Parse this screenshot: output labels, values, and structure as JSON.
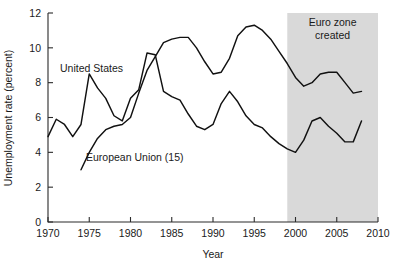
{
  "chart_data": {
    "type": "line",
    "title": "",
    "xlabel": "Year",
    "ylabel": "Unemployment rate (percent)",
    "xlim": [
      1970,
      2010
    ],
    "ylim": [
      0,
      12
    ],
    "xticks": [
      1970,
      1975,
      1980,
      1985,
      1990,
      1995,
      2000,
      2005,
      2010
    ],
    "yticks": [
      0,
      2,
      4,
      6,
      8,
      10,
      12
    ],
    "grid": false,
    "legend_position": "inline-annotations",
    "annotations": [
      {
        "id": "euro-zone-band",
        "text": "Euro zone created",
        "text_lines": [
          "Euro zone",
          "created"
        ],
        "type": "shaded-region",
        "x_start": 1999,
        "x_end": 2010,
        "color": "#d4d4d4"
      }
    ],
    "series": [
      {
        "name": "United States",
        "label": "United States",
        "color": "#111111",
        "x": [
          1970,
          1971,
          1972,
          1973,
          1974,
          1975,
          1976,
          1977,
          1978,
          1979,
          1980,
          1981,
          1982,
          1983,
          1984,
          1985,
          1986,
          1987,
          1988,
          1989,
          1990,
          1991,
          1992,
          1993,
          1994,
          1995,
          1996,
          1997,
          1998,
          1999,
          2000,
          2001,
          2002,
          2003,
          2004,
          2005,
          2006,
          2007,
          2008
        ],
        "values": [
          4.9,
          5.9,
          5.6,
          4.9,
          5.6,
          8.5,
          7.7,
          7.1,
          6.1,
          5.8,
          7.1,
          7.6,
          9.7,
          9.6,
          7.5,
          7.2,
          7.0,
          6.2,
          5.5,
          5.3,
          5.6,
          6.8,
          7.5,
          6.9,
          6.1,
          5.6,
          5.4,
          4.9,
          4.5,
          4.2,
          4.0,
          4.7,
          5.8,
          6.0,
          5.5,
          5.1,
          4.6,
          4.6,
          5.8
        ]
      },
      {
        "name": "European Union (15)",
        "label": "European Union (15)",
        "color": "#111111",
        "x": [
          1974,
          1975,
          1976,
          1977,
          1978,
          1979,
          1980,
          1981,
          1982,
          1983,
          1984,
          1985,
          1986,
          1987,
          1988,
          1989,
          1990,
          1991,
          1992,
          1993,
          1994,
          1995,
          1996,
          1997,
          1998,
          1999,
          2000,
          2001,
          2002,
          2003,
          2004,
          2005,
          2006,
          2007,
          2008
        ],
        "values": [
          3.0,
          4.0,
          4.8,
          5.3,
          5.5,
          5.6,
          6.0,
          7.4,
          8.7,
          9.5,
          10.3,
          10.5,
          10.6,
          10.6,
          10.0,
          9.2,
          8.5,
          8.6,
          9.4,
          10.7,
          11.2,
          11.3,
          11.0,
          10.5,
          9.8,
          9.1,
          8.3,
          7.8,
          8.0,
          8.5,
          8.6,
          8.6,
          8.0,
          7.4,
          7.5
        ]
      }
    ],
    "series_label_positions": [
      {
        "series": "United States",
        "x_px": 60,
        "y_px": 72
      },
      {
        "series": "European Union (15)",
        "x_px": 86,
        "y_px": 161
      }
    ]
  },
  "axis": {
    "plot_left_px": 48,
    "plot_right_px": 378,
    "plot_top_px": 13,
    "plot_bottom_px": 222
  }
}
